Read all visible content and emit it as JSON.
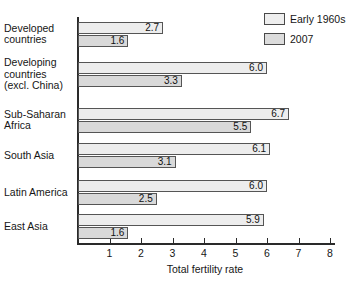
{
  "chart_data": {
    "type": "bar",
    "orientation": "horizontal",
    "title": "",
    "xlabel": "Total fertility rate",
    "ylabel": "",
    "xlim": [
      0,
      8.4
    ],
    "xticks": [
      1,
      2,
      3,
      4,
      5,
      6,
      7,
      8
    ],
    "grid": false,
    "legend_position": "top-right",
    "categories": [
      "Developed countries",
      "Developing countries (excl. China)",
      "Sub-Saharan Africa",
      "South Asia",
      "Latin America",
      "East Asia"
    ],
    "category_lines": [
      [
        "Developed",
        "countries"
      ],
      [
        "Developing",
        "countries",
        "(excl. China)"
      ],
      [
        "Sub-Saharan",
        "Africa"
      ],
      [
        "South Asia"
      ],
      [
        "Latin America"
      ],
      [
        "East Asia"
      ]
    ],
    "series": [
      {
        "name": "Early 1960s",
        "color": "#ededed",
        "values": [
          2.7,
          6.0,
          6.7,
          6.1,
          6.0,
          5.9
        ],
        "labels": [
          "2.7",
          "6.0",
          "6.7",
          "6.1",
          "6.0",
          "5.9"
        ]
      },
      {
        "name": "2007",
        "color": "#d9d9d9",
        "values": [
          1.6,
          3.3,
          5.5,
          3.1,
          2.5,
          1.6
        ],
        "labels": [
          "1.6",
          "3.3",
          "5.5",
          "3.1",
          "2.5",
          "1.6"
        ]
      }
    ]
  },
  "legend": {
    "items": [
      {
        "label": "Early 1960s",
        "swatch": "swatch-a"
      },
      {
        "label": "2007",
        "swatch": "swatch-b"
      }
    ]
  },
  "axis": {
    "x_title": "Total fertility rate",
    "tick_labels": [
      "1",
      "2",
      "3",
      "4",
      "5",
      "6",
      "7",
      "8"
    ]
  }
}
